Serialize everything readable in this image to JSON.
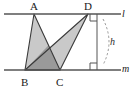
{
  "figure": {
    "kind": "geometry-diagram",
    "background_color": "#ffffff",
    "line_color": "#555555",
    "stroke_color": "#3a3a3a",
    "fill_light": "#c9c9c9",
    "fill_dark": "#9a9a9a",
    "dash_color": "#8a8a8a"
  },
  "labels": {
    "vertex_a": "A",
    "vertex_b": "B",
    "vertex_c": "C",
    "vertex_d": "D",
    "line_top": "l",
    "line_bottom": "m",
    "height": "h"
  },
  "geometry": {
    "line_top_y": 14,
    "line_bottom_y": 70,
    "line_x_start": 4,
    "line_x_end": 121,
    "points": {
      "A": {
        "x": 34,
        "y": 14
      },
      "B": {
        "x": 25,
        "y": 70
      },
      "C": {
        "x": 60,
        "y": 70
      },
      "D": {
        "x": 88,
        "y": 14
      }
    },
    "height_segment": {
      "x": 97,
      "y_top": 14,
      "y_bottom": 70
    },
    "right_angle_size": 7,
    "arc": {
      "x_top": 103,
      "y_top": 20,
      "x_bottom": 103,
      "y_bottom": 64,
      "bulge": 10
    }
  },
  "shapes": [
    {
      "name": "triangle-abc",
      "vertices": "A,B,C",
      "shade": "light"
    },
    {
      "name": "triangle-dbc",
      "vertices": "D,B,C",
      "shade": "light"
    },
    {
      "name": "triangle-overlap",
      "vertices": "B,C,intersection",
      "shade": "dark"
    }
  ]
}
